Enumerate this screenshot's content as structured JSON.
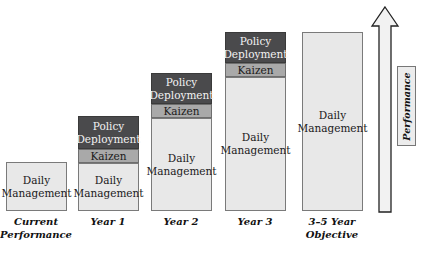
{
  "diagram": {
    "type": "stacked-progression",
    "columns": [
      {
        "label_line1": "Current",
        "label_line2": "Performance",
        "daily": "Daily Management"
      },
      {
        "label_line1": "Year 1",
        "label_line2": "",
        "daily": "Daily Management",
        "kaizen": "Kaizen",
        "policy_l1": "Policy",
        "policy_l2": "Deployment"
      },
      {
        "label_line1": "Year 2",
        "label_line2": "",
        "daily": "Daily Management",
        "kaizen": "Kaizen",
        "policy_l1": "Policy",
        "policy_l2": "Deployment"
      },
      {
        "label_line1": "Year 3",
        "label_line2": "",
        "daily": "Daily Management",
        "kaizen": "Kaizen",
        "policy_l1": "Policy",
        "policy_l2": "Deployment"
      },
      {
        "label_line1": "3–5 Year",
        "label_line2": "Objective",
        "daily": "Daily Management"
      }
    ],
    "axis_label": "Performance",
    "colors": {
      "daily": "#e8e8e8",
      "kaizen": "#a9a9a9",
      "policy": "#4a4a4c"
    }
  }
}
